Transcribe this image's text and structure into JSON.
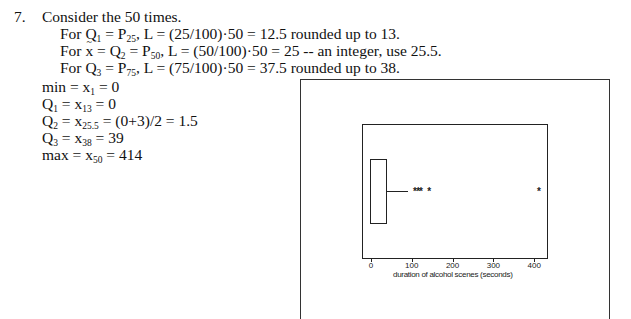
{
  "problem": {
    "number": "7.",
    "intro": "Consider the 50 times.",
    "steps": [
      {
        "prefix": "For Q",
        "q_sub": "1",
        "mid": " = P",
        "p_sub": "25",
        "rest": ", L = (25/100)·50 = 12.5 rounded up to 13."
      },
      {
        "prefix": "For ",
        "xbar": "x",
        "mid_a": " = Q",
        "q_sub": "2",
        "mid": " = P",
        "p_sub": "50",
        "rest": ", L = (50/100)·50 = 25 -- an integer, use 25.5."
      },
      {
        "prefix": "For Q",
        "q_sub": "3",
        "mid": " = P",
        "p_sub": "75",
        "rest": ", L = (75/100)·50 = 37.5 rounded up to 38."
      }
    ],
    "results": [
      {
        "label": "min = x",
        "sub": "1",
        "rest": " = 0"
      },
      {
        "label": "Q",
        "label_sub": "1",
        "mid": " = x",
        "sub": "13",
        "rest": " = 0"
      },
      {
        "label": "Q",
        "label_sub": "2",
        "mid": " = x",
        "sub": "25.5",
        "rest": " = (0+3)/2 = 1.5"
      },
      {
        "label": "Q",
        "label_sub": "3",
        "mid": " = x",
        "sub": "38",
        "rest": " = 39"
      },
      {
        "label": "max = x",
        "sub": "50",
        "rest": " = 414"
      }
    ]
  },
  "chart_data": {
    "type": "boxplot",
    "orientation": "horizontal",
    "title": "",
    "xlabel": "duration of alcohol scenes (seconds)",
    "ylabel": "",
    "xlim": [
      -20,
      430
    ],
    "x_ticks": [
      0,
      100,
      200,
      300,
      400
    ],
    "x_tick_labels": [
      "0",
      "100",
      "200",
      "300",
      "400"
    ],
    "grid": false,
    "box": {
      "min": 0,
      "q1": 0,
      "median": 1.5,
      "q3": 39,
      "whisker_low": 0,
      "whisker_high": 90
    },
    "outliers": [
      110,
      118,
      125,
      145,
      414
    ],
    "outlier_marker": "*"
  }
}
